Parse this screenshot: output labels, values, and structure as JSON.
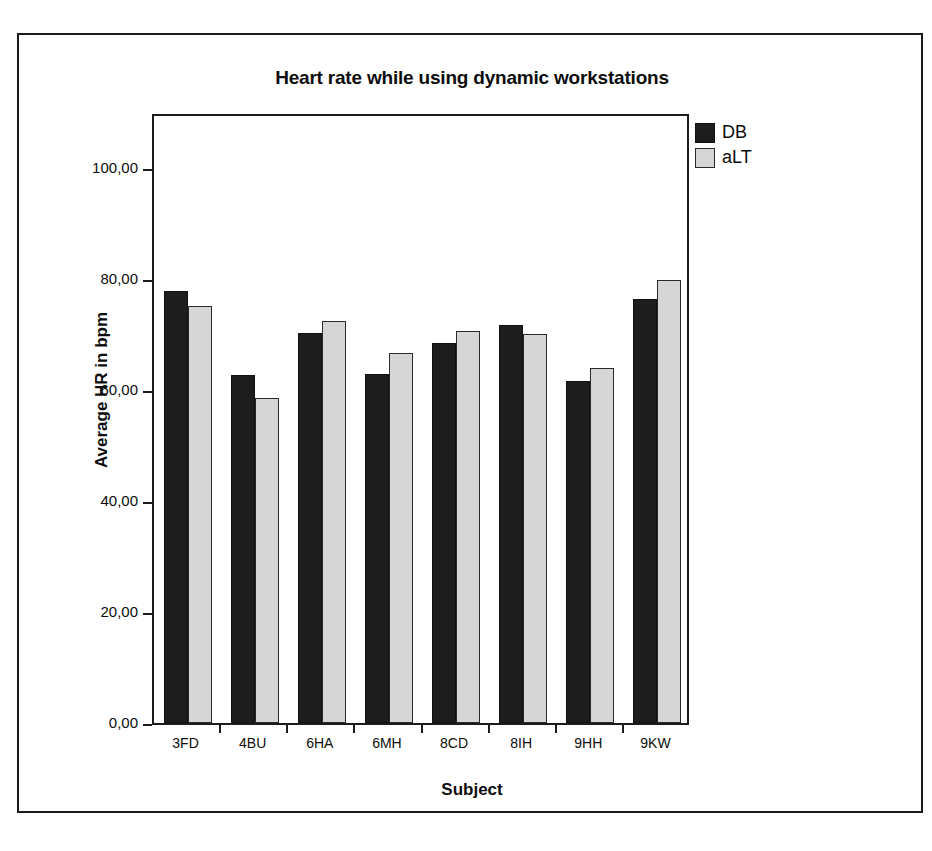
{
  "chart_data": {
    "type": "bar",
    "title": "Heart rate while using dynamic workstations",
    "xlabel": "Subject",
    "ylabel": "Average HR in bpm",
    "categories": [
      "3FD",
      "4BU",
      "6HA",
      "6MH",
      "8CD",
      "8IH",
      "9HH",
      "9KW"
    ],
    "series": [
      {
        "name": "DB",
        "color": "#1d1d1d",
        "values": [
          77.7,
          62.7,
          70.2,
          62.8,
          68.4,
          71.6,
          61.5,
          76.4
        ]
      },
      {
        "name": "aLT",
        "color": "#d6d6d6",
        "values": [
          75.1,
          58.6,
          72.3,
          66.6,
          70.6,
          70.1,
          63.9,
          79.7
        ]
      }
    ],
    "ylim": [
      0,
      110
    ],
    "yticks": [
      0,
      20,
      40,
      60,
      80,
      100
    ],
    "ytick_labels": [
      "0,00",
      "20,00",
      "40,00",
      "60,00",
      "80,00",
      "100,00"
    ],
    "grid": false,
    "legend_position": "top-right-outside"
  },
  "legend": {
    "entries": [
      {
        "label": "DB",
        "swatch": "dark-swatch"
      },
      {
        "label": "aLT",
        "swatch": "light-swatch"
      }
    ]
  }
}
